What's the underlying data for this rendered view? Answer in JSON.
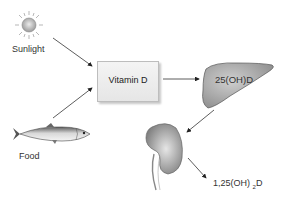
{
  "diagram": {
    "sources": [
      {
        "label": "Sunlight",
        "icon": "sun-icon"
      },
      {
        "label": "Food",
        "icon": "fish-icon"
      }
    ],
    "nodes": {
      "vitamin_d": {
        "label": "Vitamin D",
        "shape": "box"
      },
      "liver": {
        "label": "25(OH)D",
        "shape": "liver-icon"
      },
      "kidney": {
        "label": "",
        "shape": "kidney-icon"
      },
      "product": {
        "label_main": "1,25(OH)",
        "label_sub": "2",
        "label_end": "D"
      }
    },
    "edges": [
      {
        "from": "Sunlight",
        "to": "Vitamin D"
      },
      {
        "from": "Food",
        "to": "Vitamin D"
      },
      {
        "from": "Vitamin D",
        "to": "25(OH)D"
      },
      {
        "from": "25(OH)D",
        "to": "kidney"
      },
      {
        "from": "kidney",
        "to": "1,25(OH)2D"
      }
    ],
    "colors": {
      "arrow": "#333333",
      "organ_fill": "#a8a8a8",
      "box_fill": "#eeeeee"
    }
  }
}
